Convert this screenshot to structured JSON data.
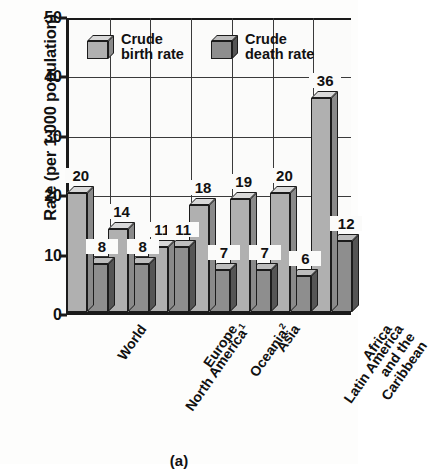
{
  "figure": {
    "caption": "(a)"
  },
  "chart_data": {
    "type": "bar",
    "title": "",
    "xlabel": "",
    "ylabel": "Rate (per 1,000 population)",
    "ylim": [
      0,
      50
    ],
    "yticks": [
      0,
      10,
      20,
      30,
      40,
      50
    ],
    "grid": true,
    "legend_position": "top-inside",
    "categories": [
      "World",
      "North America1",
      "Europe",
      "Oceania2",
      "Asia",
      "Latin America\nand the\nCaribbean",
      "Africa"
    ],
    "category_labels": [
      {
        "text": "World",
        "sup": ""
      },
      {
        "text": "North America",
        "sup": "1"
      },
      {
        "text": "Europe",
        "sup": ""
      },
      {
        "text": "Oceania",
        "sup": "2"
      },
      {
        "text": "Asia",
        "sup": ""
      },
      {
        "text": "Latin America\nand the\nCaribbean",
        "sup": ""
      },
      {
        "text": "Africa",
        "sup": ""
      }
    ],
    "series": [
      {
        "name": "Crude birth rate",
        "values": [
          20,
          14,
          11,
          18,
          19,
          20,
          36
        ],
        "color": "#b0b0b0"
      },
      {
        "name": "Crude death rate",
        "values": [
          8,
          8,
          11,
          7,
          7,
          6,
          12
        ],
        "color": "#8e8e8e"
      }
    ]
  },
  "legend": {
    "items": [
      {
        "label_line1": "Crude",
        "label_line2": "birth rate"
      },
      {
        "label_line1": "Crude",
        "label_line2": "death rate"
      }
    ]
  }
}
